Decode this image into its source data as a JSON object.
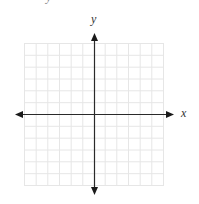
{
  "figure": {
    "type": "coordinate-plane",
    "grid": {
      "columns": 12,
      "rows": 12,
      "color": "#e3e3e3"
    },
    "axes": {
      "color": "#222222",
      "x_label": "x",
      "y_label": "y",
      "arrows": "both-ends"
    },
    "clipped_glyph": "y"
  }
}
